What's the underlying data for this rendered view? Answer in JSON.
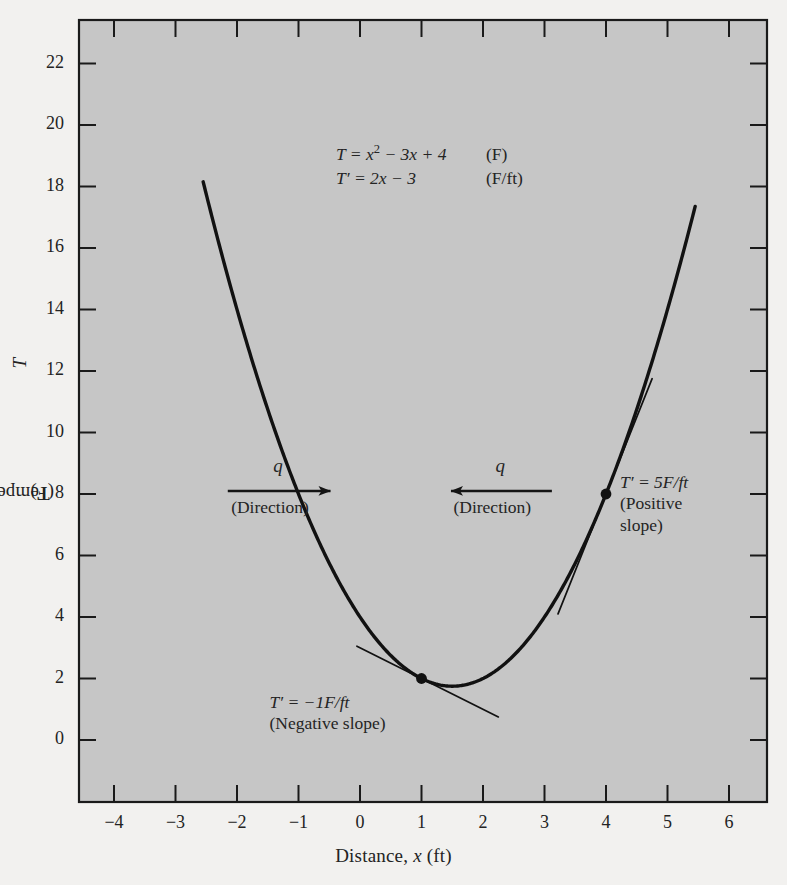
{
  "chart_data": {
    "type": "line",
    "title": "",
    "xlabel": "Distance, x (ft)",
    "ylabel": "Temperature, T (F)",
    "xlim": [
      -4.55,
      6.55
    ],
    "ylim": [
      -1.6,
      23.5
    ],
    "xticks": [
      "-4",
      "-3",
      "-2",
      "-1",
      "0",
      "1",
      "2",
      "3",
      "4",
      "5",
      "6"
    ],
    "xtick_values": [
      -4,
      -3,
      -2,
      -1,
      0,
      1,
      2,
      3,
      4,
      5,
      6
    ],
    "yticks": [
      "0",
      "2",
      "4",
      "6",
      "8",
      "10",
      "12",
      "14",
      "16",
      "18",
      "20",
      "22"
    ],
    "ytick_values": [
      0,
      2,
      4,
      6,
      8,
      10,
      12,
      14,
      16,
      18,
      20,
      22
    ],
    "grid": false,
    "legend": "none",
    "equation": "T = x^2 - 3x + 4",
    "derivative": "T' = 2x - 3",
    "curve_domain": [
      -2.55,
      5.45
    ],
    "series": [
      {
        "name": "T = x^2 - 3x + 4",
        "x": [
          -2.55,
          -2.2,
          -1.9,
          -1.6,
          -1.3,
          -1.0,
          -0.7,
          -0.4,
          -0.1,
          0.2,
          0.5,
          0.8,
          1.1,
          1.4,
          1.7,
          2.0,
          2.3,
          2.6,
          2.9,
          3.2,
          3.5,
          3.8,
          4.1,
          4.4,
          4.7,
          5.0,
          5.3,
          5.45
        ],
        "y": [
          18.15,
          15.44,
          13.31,
          11.36,
          9.59,
          8.0,
          6.59,
          5.36,
          4.31,
          3.44,
          2.75,
          2.24,
          1.91,
          1.76,
          1.79,
          2.0,
          2.39,
          2.96,
          3.71,
          4.64,
          5.75,
          7.04,
          8.51,
          10.16,
          11.99,
          14.0,
          16.19,
          17.35
        ]
      }
    ],
    "markers": [
      {
        "x": 1,
        "y": 2,
        "label": "T' = -1F/ft",
        "sublabel": "(Negative slope)",
        "slope": -1
      },
      {
        "x": 4,
        "y": 8,
        "label": "T' = 5F/ft",
        "sublabel": "(Positive slope)",
        "slope": 5
      }
    ],
    "tangents": [
      {
        "at_x": 1,
        "at_y": 2,
        "slope": -1,
        "x_from": -0.05,
        "x_to": 2.25
      },
      {
        "at_x": 4,
        "at_y": 8,
        "slope": 5,
        "x_from": 3.22,
        "x_to": 4.75
      }
    ],
    "flux_arrows": [
      {
        "symbol": "q",
        "caption": "(Direction)",
        "direction": "right",
        "x_from": -2.15,
        "x_to": -0.48,
        "y": 8.1
      },
      {
        "symbol": "q",
        "caption": "(Direction)",
        "direction": "left",
        "x_from": 3.12,
        "x_to": 1.48,
        "y": 8.1
      }
    ]
  },
  "equations": {
    "line1_lhs_pre": "T = x",
    "line1_exp": "2",
    "line1_lhs_post": " − 3x + 4",
    "line1_units": "(F)",
    "line2_lhs": "T′ = 2x − 3",
    "line2_units": "(F/ft)"
  },
  "annotations": {
    "negative_slope_line1": "T′ = −1F/ft",
    "negative_slope_line2": "(Negative slope)",
    "positive_slope_line1": "T′ = 5F/ft",
    "positive_slope_line2": "(Positive",
    "positive_slope_line3": "slope)",
    "flux_symbol_left": "q",
    "flux_caption_left": "(Direction)",
    "flux_symbol_right": "q",
    "flux_caption_right": "(Direction)"
  },
  "axes": {
    "x_title_pre": "Distance, ",
    "x_title_var": "x",
    "x_title_post": " (ft)",
    "y_title_pre": "Temperature, ",
    "y_title_var": "T",
    "y_title_post": " (F)"
  },
  "colors": {
    "figure_background": "#f2f1ef",
    "plot_background": "#c6c6c6",
    "curve": "#111111",
    "tangent": "#111111",
    "frame": "#1a1a1a",
    "text": "#242424"
  }
}
